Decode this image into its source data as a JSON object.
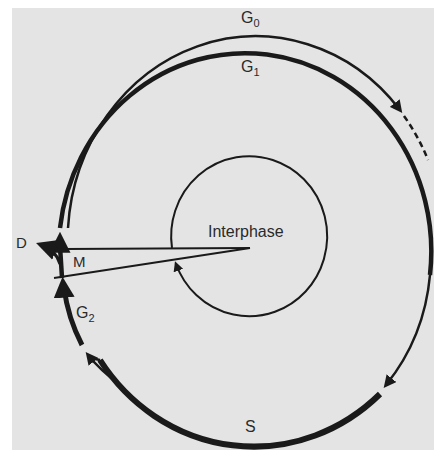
{
  "figure": {
    "center_label": "Interphase",
    "phases": [
      {
        "id": "g0",
        "label": "G",
        "subscript": "0"
      },
      {
        "id": "g1",
        "label": "G",
        "subscript": "1"
      },
      {
        "id": "s",
        "label": "S"
      },
      {
        "id": "g2",
        "label": "G",
        "subscript": "2"
      },
      {
        "id": "m",
        "label": "M"
      },
      {
        "id": "d",
        "label": "D"
      }
    ],
    "colors": {
      "background": "#e4e4e4",
      "page": "#ffffff",
      "stroke": "#1a1a1a",
      "text": "#2a2a2a"
    }
  }
}
